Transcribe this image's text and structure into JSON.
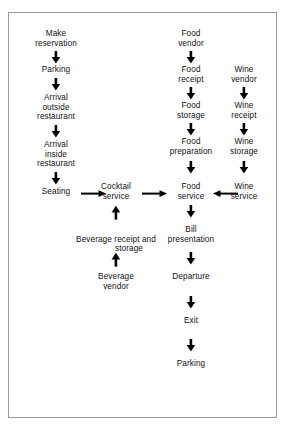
{
  "diagram": {
    "background_color": "#ffffff",
    "border_color": "#9a9a9a",
    "text_color": "#111111",
    "arrow_color": "#000000",
    "nodes": {
      "make_reservation": "Make\nreservation",
      "parking_top": "Parking",
      "arrival_outside": "Arrival\noutside\nrestaurant",
      "arrival_inside": "Arrival\ninside\nrestaurant",
      "seating": "Seating",
      "cocktail_service": "Cocktail\nservice",
      "beverage_receipt_line1": "Beverage receipt and",
      "beverage_receipt_line2": "storage",
      "beverage_vendor": "Beverage\nvendor",
      "food_vendor": "Food\nvendor",
      "food_receipt": "Food\nreceipt",
      "food_storage": "Food\nstorage",
      "food_preparation": "Food\npreparation",
      "food_service": "Food\nservice",
      "bill_presentation": "Bill\npresentation",
      "departure": "Departure",
      "exit": "Exit",
      "parking_bottom": "Parking",
      "wine_vendor": "Wine\nvendor",
      "wine_receipt": "Wine\nreceipt",
      "wine_storage": "Wine\nstorage",
      "wine_service": "Wine\nservice"
    },
    "edges": [
      {
        "from": "make_reservation",
        "to": "parking_top",
        "direction": "down"
      },
      {
        "from": "parking_top",
        "to": "arrival_outside",
        "direction": "down"
      },
      {
        "from": "arrival_outside",
        "to": "arrival_inside",
        "direction": "down"
      },
      {
        "from": "arrival_inside",
        "to": "seating",
        "direction": "down"
      },
      {
        "from": "seating",
        "to": "cocktail_service",
        "direction": "right"
      },
      {
        "from": "cocktail_service",
        "to": "food_service",
        "direction": "right"
      },
      {
        "from": "wine_service",
        "to": "food_service",
        "direction": "left"
      },
      {
        "from": "beverage_receipt",
        "to": "cocktail_service",
        "direction": "up"
      },
      {
        "from": "beverage_vendor",
        "to": "beverage_receipt",
        "direction": "up"
      },
      {
        "from": "food_vendor",
        "to": "food_receipt",
        "direction": "down"
      },
      {
        "from": "food_receipt",
        "to": "food_storage",
        "direction": "down"
      },
      {
        "from": "food_storage",
        "to": "food_preparation",
        "direction": "down"
      },
      {
        "from": "food_preparation",
        "to": "food_service",
        "direction": "down"
      },
      {
        "from": "food_service",
        "to": "bill_presentation",
        "direction": "down"
      },
      {
        "from": "bill_presentation",
        "to": "departure",
        "direction": "down"
      },
      {
        "from": "departure",
        "to": "exit",
        "direction": "down"
      },
      {
        "from": "exit",
        "to": "parking_bottom",
        "direction": "down"
      },
      {
        "from": "wine_vendor",
        "to": "wine_receipt",
        "direction": "down"
      },
      {
        "from": "wine_receipt",
        "to": "wine_storage",
        "direction": "down"
      },
      {
        "from": "wine_storage",
        "to": "wine_service",
        "direction": "down"
      }
    ]
  }
}
